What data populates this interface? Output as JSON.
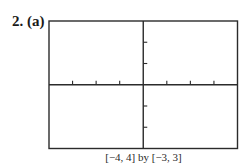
{
  "problem": {
    "number": "2.",
    "part": "(a)"
  },
  "viewing_window": {
    "caption": "[−4, 4] by [−3, 3]"
  },
  "colors": {
    "frame": "#2b2b2b",
    "axis": "#2b2b2b",
    "background": "#ffffff"
  },
  "chart_data": {
    "type": "line",
    "title": "2. (a)",
    "subtitle": "",
    "xlabel": "",
    "ylabel": "",
    "xlim": [
      -4,
      4
    ],
    "ylim": [
      -3,
      3
    ],
    "x_ticks": [
      -3,
      -2,
      -1,
      1,
      2,
      3
    ],
    "y_ticks": [
      -2,
      -1,
      1,
      2
    ],
    "tick_labels_shown": false,
    "grid": false,
    "legend": null,
    "series": [],
    "annotations": [
      "[−4, 4] by [−3, 3]"
    ]
  }
}
